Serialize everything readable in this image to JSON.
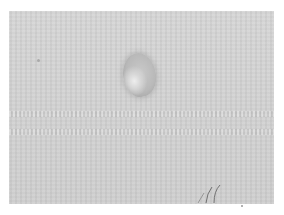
{
  "image": {
    "description": "Grayscale photograph of a single small oval object on a finely textured light gray surface, with white border",
    "background_color": "#ffffff",
    "surface_color": "#d3d3d3",
    "object_color": "#b5b5b5",
    "highlight_color": "#eeeeee",
    "handwritten_mark": "pencil stroke marks near lower right"
  }
}
